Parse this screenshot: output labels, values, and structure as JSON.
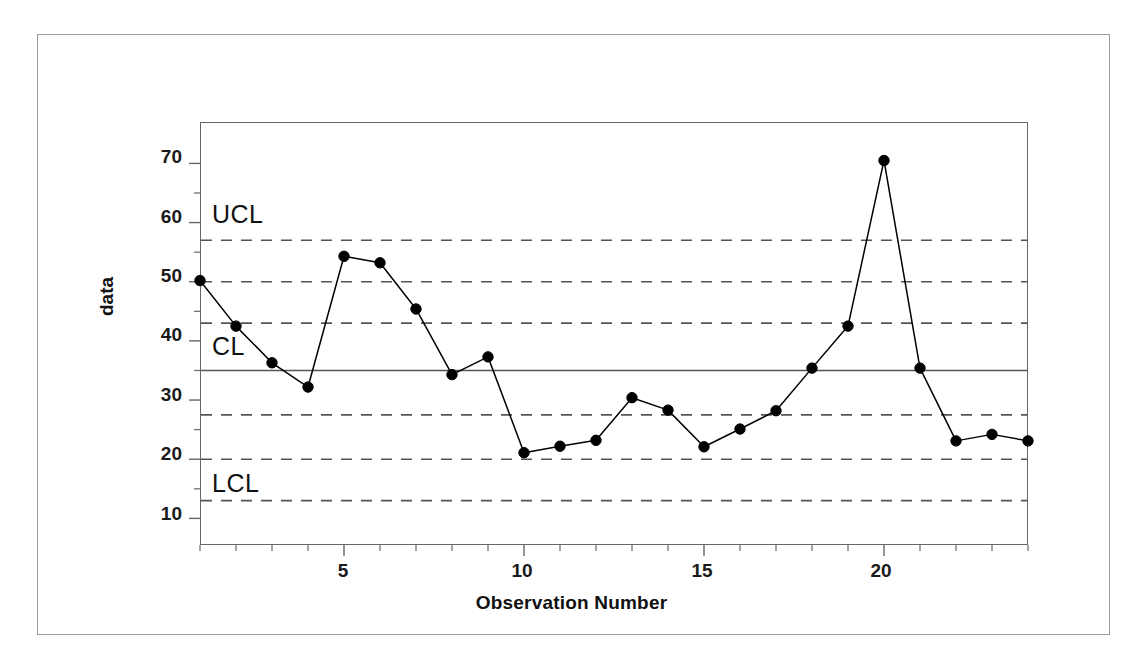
{
  "chart_data": {
    "type": "line",
    "title": "",
    "xlabel": "Observation Number",
    "ylabel": "data",
    "x": [
      1,
      2,
      3,
      4,
      5,
      6,
      7,
      8,
      9,
      10,
      11,
      12,
      13,
      14,
      15,
      16,
      17,
      18,
      19,
      20,
      21,
      22,
      23,
      24
    ],
    "values": [
      50.2,
      42.5,
      36.3,
      32.2,
      54.3,
      53.2,
      45.4,
      34.3,
      37.3,
      21.1,
      22.2,
      23.2,
      30.4,
      28.3,
      22.1,
      25.1,
      28.2,
      35.4,
      42.5,
      70.5,
      35.4,
      23.1,
      24.2,
      23.1
    ],
    "series": [
      {
        "name": "data",
        "values": [
          50.2,
          42.5,
          36.3,
          32.2,
          54.3,
          53.2,
          45.4,
          34.3,
          37.3,
          21.1,
          22.2,
          23.2,
          30.4,
          28.3,
          22.1,
          25.1,
          28.2,
          35.4,
          42.5,
          70.5,
          35.4,
          23.1,
          24.2,
          23.1
        ],
        "marker": "filled-circle",
        "color": "#000000"
      }
    ],
    "xlim": [
      1,
      24
    ],
    "ylim": [
      5.5,
      77
    ],
    "grid": false,
    "legend": "none",
    "xticks": [
      5,
      10,
      15,
      20
    ],
    "xtick_labels": [
      "5",
      "10",
      "15",
      "20"
    ],
    "xminor_ticks": [
      1,
      2,
      3,
      4,
      5,
      6,
      7,
      8,
      9,
      10,
      11,
      12,
      13,
      14,
      15,
      16,
      17,
      18,
      19,
      20,
      21,
      22,
      23,
      24
    ],
    "yticks": [
      10,
      20,
      30,
      40,
      50,
      60,
      70
    ],
    "ytick_labels": [
      "10",
      "20",
      "30",
      "40",
      "50",
      "60",
      "70"
    ],
    "control_limits": {
      "center_line": {
        "label": "CL",
        "value": 35,
        "style": "solid",
        "color": "#555555"
      },
      "upper_control_limit": {
        "label": "UCL",
        "value": 57,
        "style": "dashed",
        "color": "#555555"
      },
      "lower_control_limit": {
        "label": "LCL",
        "value": 13,
        "style": "dashed",
        "color": "#555555"
      },
      "zone_lines": [
        {
          "value": 50,
          "style": "dashed"
        },
        {
          "value": 43,
          "style": "dashed"
        },
        {
          "value": 27.5,
          "style": "dashed"
        },
        {
          "value": 20,
          "style": "dashed"
        }
      ]
    },
    "annotations": [
      {
        "text": "UCL",
        "x": 1.3,
        "y": 60.0
      },
      {
        "text": "CL",
        "x": 1.3,
        "y": 38.2
      },
      {
        "text": "LCL",
        "x": 1.3,
        "y": 15.8
      }
    ]
  },
  "colors": {
    "line": "#000000",
    "marker": "#000000",
    "limit_line": "#555555",
    "axis": "#666666",
    "figure_border": "#9a9a9a",
    "text": "#111111",
    "background": "#ffffff"
  }
}
